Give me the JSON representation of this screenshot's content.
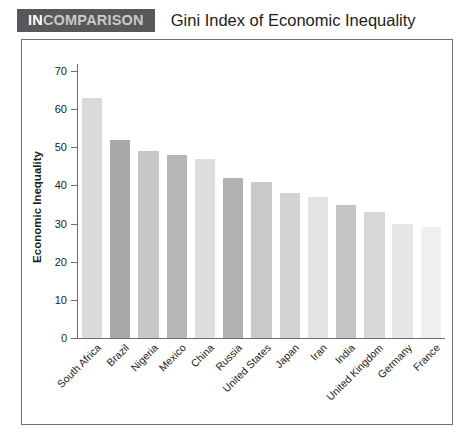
{
  "header": {
    "brand_prefix": "IN",
    "brand_suffix": "COMPARISON",
    "title": "Gini Index of Economic Inequality",
    "brand_box_color": "#58585a"
  },
  "chart_data": {
    "type": "bar",
    "title": "Gini Index of Economic Inequality",
    "xlabel": "",
    "ylabel": "Economic Inequality",
    "ylim": [
      0,
      70
    ],
    "yticks": [
      0,
      10,
      20,
      30,
      40,
      50,
      60,
      70
    ],
    "grid": false,
    "legend": "none",
    "categories": [
      "South Africa",
      "Brazil",
      "Nigeria",
      "Mexico",
      "China",
      "Russia",
      "United States",
      "Japan",
      "Iran",
      "India",
      "United Kingdom",
      "Germany",
      "France"
    ],
    "values": [
      63,
      52,
      49,
      48,
      47,
      42,
      41,
      38,
      37,
      35,
      33,
      30,
      29
    ],
    "bar_colors": [
      "#d9dadb",
      "#a8a9ab",
      "#c6c7c9",
      "#b5b6b8",
      "#dcdddf",
      "#b0b1b3",
      "#c9cacc",
      "#d2d3d5",
      "#e2e3e5",
      "#c3c4c6",
      "#d6d7d9",
      "#e6e7e9",
      "#eeeff0"
    ]
  }
}
